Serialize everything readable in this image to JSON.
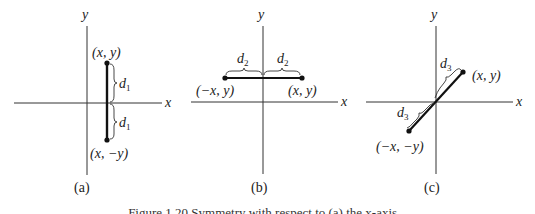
{
  "figure": {
    "panels": [
      {
        "id": "a",
        "caption": "(a)",
        "x_axis_label": "x",
        "y_axis_label": "y",
        "point_top": "(x, y)",
        "point_bottom": "(x, −y)",
        "distance_label": "d",
        "distance_sub": "1",
        "symmetry": "x-axis"
      },
      {
        "id": "b",
        "caption": "(b)",
        "x_axis_label": "x",
        "y_axis_label": "y",
        "point_left": "(−x, y)",
        "point_right": "(x, y)",
        "distance_label": "d",
        "distance_sub": "2",
        "symmetry": "y-axis"
      },
      {
        "id": "c",
        "caption": "(c)",
        "x_axis_label": "x",
        "y_axis_label": "y",
        "point_upper": "(x, y)",
        "point_lower": "(−x, −y)",
        "distance_label": "d",
        "distance_sub": "3",
        "symmetry": "origin"
      }
    ],
    "caption": "Figure 1.20  Symmetry with respect to (a) the x-axis..."
  }
}
